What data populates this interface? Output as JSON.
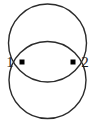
{
  "figure": {
    "name": "two-intersecting-circles-graph",
    "background_color": "#ffffff",
    "stroke_color": "#2b2b2b",
    "node_color": "#000000",
    "stroke_width": 1.4,
    "width": 95,
    "height": 124
  },
  "nodes": [
    {
      "id": "1",
      "label": "1",
      "cx": 22,
      "cy": 62,
      "marker": "square-node-icon",
      "size": 5,
      "label_x": 10,
      "label_y": 67,
      "label_anchor": "middle"
    },
    {
      "id": "2",
      "label": "2",
      "cx": 73,
      "cy": 62,
      "marker": "square-node-icon",
      "size": 5,
      "label_x": 85,
      "label_y": 67,
      "label_anchor": "middle"
    }
  ],
  "circles": [
    {
      "name": "upper-circle",
      "cx": 47.5,
      "cy": 43,
      "r": 39
    },
    {
      "name": "lower-circle",
      "cx": 47.5,
      "cy": 80,
      "r": 38.5
    }
  ]
}
